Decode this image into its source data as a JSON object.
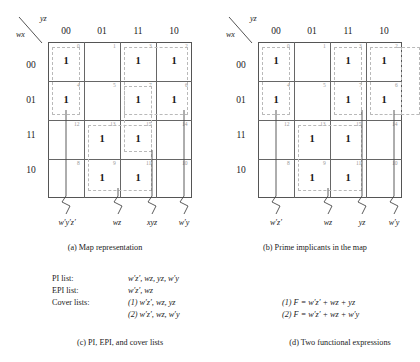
{
  "figure": {
    "axis_top_label": "yz",
    "axis_left_label": "wx",
    "col_headers": [
      "00",
      "01",
      "11",
      "10"
    ],
    "row_headers": [
      "00",
      "01",
      "11",
      "10"
    ],
    "cell_numbers_by_row": [
      [
        "0",
        "1",
        "3",
        "2"
      ],
      [
        "4",
        "5",
        "7",
        "6"
      ],
      [
        "12",
        "13",
        "15",
        "14"
      ],
      [
        "8",
        "9",
        "11",
        "10"
      ]
    ],
    "minterm_value": "1",
    "ones_by_row": [
      [
        true,
        false,
        true,
        true
      ],
      [
        true,
        false,
        true,
        true
      ],
      [
        false,
        true,
        true,
        false
      ],
      [
        false,
        true,
        true,
        false
      ]
    ]
  },
  "map_a": {
    "caption": "(a)  Map representation",
    "terms": [
      {
        "label_html": "w′y′z′"
      },
      {
        "label_html": "wz"
      },
      {
        "label_html": "xyz"
      },
      {
        "label_html": "w′y"
      }
    ]
  },
  "map_b": {
    "caption": "(b)  Prime implicants in the map",
    "terms": [
      {
        "label_html": "w′z′"
      },
      {
        "label_html": "wz"
      },
      {
        "label_html": "yz"
      },
      {
        "label_html": "w′y"
      }
    ]
  },
  "lists": {
    "caption": "(c)  PI, EPI, and cover lists",
    "pi_label": "PI list:",
    "pi_value": "w′z′, wz, yz, w′y",
    "epi_label": "EPI list:",
    "epi_value": "w′z′, wz",
    "cover_label": "Cover lists:",
    "cover_value_1": "(1) w′z′, wz, yz",
    "cover_value_2": "(2) w′z′, wz, w′y"
  },
  "expressions": {
    "caption": "(d)  Two functional expressions",
    "line_1": "(1) F = w′z′ + wz + yz",
    "line_2": "(2) F = w′z′ + wz + w′y"
  },
  "colors": {
    "grid_line": "#666666",
    "group_dash": "#b9b9b9",
    "cell_number": "#9a9a9a",
    "text": "#1a1a1a"
  }
}
